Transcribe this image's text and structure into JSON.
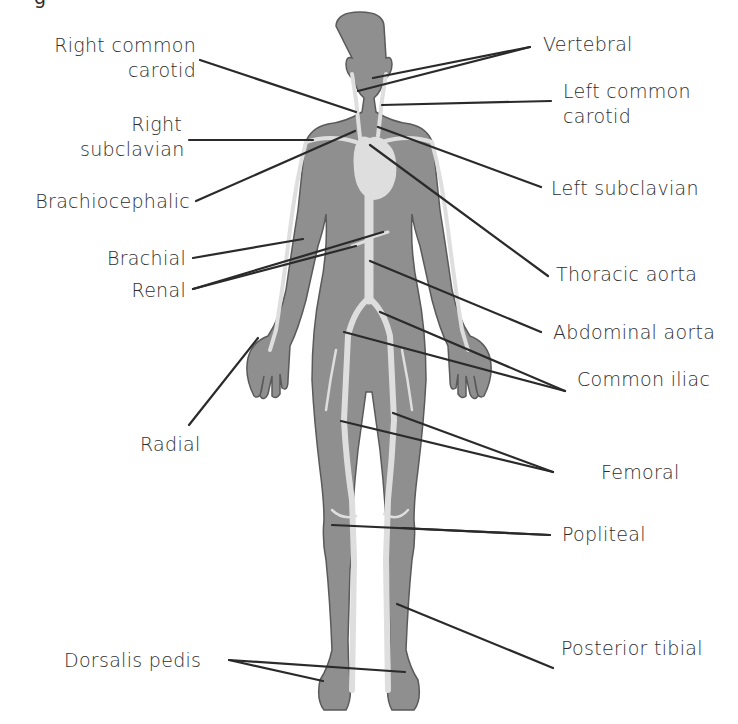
{
  "diagram": {
    "colors": {
      "body_fill": "#8f8f8f",
      "body_outline": "#5a5a5a",
      "artery_fill": "#dedede",
      "leader_line": "#2a2a2a",
      "text": "#2e2e2e",
      "background": "#ffffff"
    },
    "cropped_top_text": "g",
    "labels_left": [
      {
        "id": "right-common-carotid",
        "lines": [
          "Right common",
          "carotid"
        ]
      },
      {
        "id": "right-subclavian",
        "lines": [
          "Right",
          "subclavian"
        ]
      },
      {
        "id": "brachiocephalic",
        "lines": [
          "Brachiocephalic"
        ]
      },
      {
        "id": "brachial",
        "lines": [
          "Brachial"
        ]
      },
      {
        "id": "renal",
        "lines": [
          "Renal"
        ]
      },
      {
        "id": "radial",
        "lines": [
          "Radial"
        ]
      },
      {
        "id": "dorsalis-pedis",
        "lines": [
          "Dorsalis pedis"
        ]
      }
    ],
    "labels_right": [
      {
        "id": "vertebral",
        "lines": [
          "Vertebral"
        ]
      },
      {
        "id": "left-common-carotid",
        "lines": [
          "Left common",
          "carotid"
        ]
      },
      {
        "id": "left-subclavian",
        "lines": [
          "Left subclavian"
        ]
      },
      {
        "id": "thoracic-aorta",
        "lines": [
          "Thoracic aorta"
        ]
      },
      {
        "id": "abdominal-aorta",
        "lines": [
          "Abdominal aorta"
        ]
      },
      {
        "id": "common-iliac",
        "lines": [
          "Common iliac"
        ]
      },
      {
        "id": "femoral",
        "lines": [
          "Femoral"
        ]
      },
      {
        "id": "popliteal",
        "lines": [
          "Popliteal"
        ]
      },
      {
        "id": "posterior-tibial",
        "lines": [
          "Posterior tibial"
        ]
      }
    ]
  }
}
